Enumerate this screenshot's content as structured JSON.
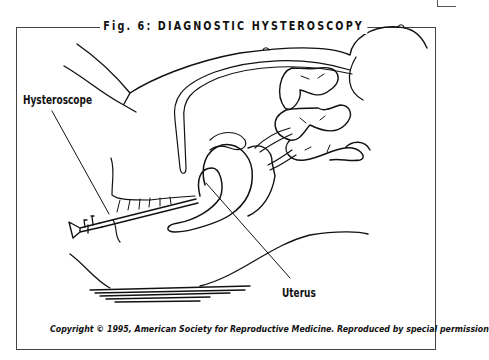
{
  "figure": {
    "title": "Fig. 6: DIAGNOSTIC HYSTEROSCOPY",
    "labels": {
      "hysteroscope": "Hysteroscope",
      "uterus": "Uterus"
    },
    "caption": "Copyright © 1995, American Society for Reproductive Medicine. Reproduced by special permission",
    "colors": {
      "line": "#111111",
      "frame": "#444444",
      "background": "#ffffff"
    }
  }
}
